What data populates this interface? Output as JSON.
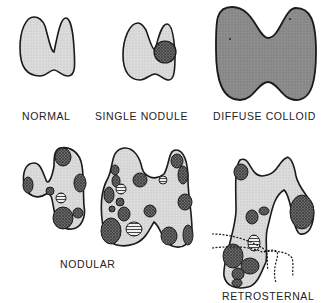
{
  "figure": {
    "type": "goiter-types-illustration",
    "colors": {
      "outline": "#1a1a1a",
      "gland_fill": "#d6d6d6",
      "colloid_fill": "#8a8a8a",
      "nodule_dark": "#5a5a5a",
      "nodule_striped": "#bdbdbd",
      "background": "#ffffff"
    },
    "panels": [
      {
        "id": "normal",
        "label": "NORMAL"
      },
      {
        "id": "single-nodule",
        "label": "SINGLE NODULE"
      },
      {
        "id": "diffuse-colloid",
        "label": "DIFFUSE COLLOID"
      },
      {
        "id": "nodular",
        "label": "NODULAR"
      },
      {
        "id": "retrosternal",
        "label": "RETROSTERNAL"
      }
    ]
  }
}
